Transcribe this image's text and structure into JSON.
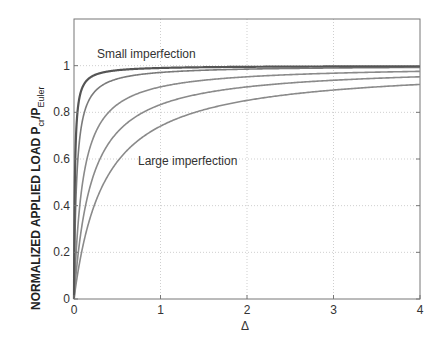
{
  "chart_data": {
    "type": "line",
    "title": "",
    "xlabel": "Δ",
    "ylabel": "NORMALIZED APPLIED LOAD P_cr/P_Euler",
    "ylabel_parts": {
      "main": "NORMALIZED APPLIED LOAD P",
      "sub1": "cr",
      "slash": "/P",
      "sub2": "Euler"
    },
    "xlim": [
      0,
      4
    ],
    "ylim": [
      0,
      1.2
    ],
    "xticks": [
      0,
      1,
      2,
      3,
      4
    ],
    "xtick_labels": [
      "0",
      "1",
      "2",
      "3",
      "4"
    ],
    "yticks": [
      0,
      0.2,
      0.4,
      0.6,
      0.8,
      1
    ],
    "ytick_labels": [
      "0",
      "0.2",
      "0.4",
      "0.6",
      "0.8",
      "1"
    ],
    "grid": true,
    "legend": null,
    "annotations": [
      {
        "text": "Small imperfection",
        "x": 0.27,
        "y": 1.05
      },
      {
        "text": "Large imperfection",
        "x": 0.75,
        "y": 0.59
      }
    ],
    "series": [
      {
        "name": "imperfection e=0.01",
        "imperfection": 0.01,
        "color": "#555555",
        "width": 2.2,
        "x": [
          0,
          0.05,
          0.1,
          0.25,
          0.5,
          1,
          2,
          3,
          4
        ],
        "values": [
          0,
          0.83,
          0.91,
          0.96,
          0.98,
          0.99,
          0.995,
          0.997,
          0.998
        ]
      },
      {
        "name": "imperfection e=0.03",
        "imperfection": 0.03,
        "color": "#7a7a7a",
        "width": 1.6,
        "x": [
          0,
          0.05,
          0.1,
          0.25,
          0.5,
          1,
          2,
          3,
          4
        ],
        "values": [
          0,
          0.63,
          0.77,
          0.89,
          0.94,
          0.97,
          0.985,
          0.99,
          0.993
        ]
      },
      {
        "name": "imperfection e=0.1",
        "imperfection": 0.1,
        "color": "#8a8a8a",
        "width": 1.6,
        "x": [
          0,
          0.05,
          0.1,
          0.25,
          0.5,
          1,
          2,
          3,
          4
        ],
        "values": [
          0,
          0.33,
          0.5,
          0.71,
          0.83,
          0.91,
          0.95,
          0.97,
          0.976
        ]
      },
      {
        "name": "imperfection e=0.2",
        "imperfection": 0.2,
        "color": "#8a8a8a",
        "width": 1.6,
        "x": [
          0,
          0.05,
          0.1,
          0.25,
          0.5,
          1,
          2,
          3,
          4
        ],
        "values": [
          0,
          0.2,
          0.33,
          0.56,
          0.71,
          0.83,
          0.91,
          0.94,
          0.952
        ]
      },
      {
        "name": "imperfection e=0.35",
        "imperfection": 0.35,
        "color": "#8a8a8a",
        "width": 1.6,
        "x": [
          0,
          0.05,
          0.1,
          0.25,
          0.5,
          1,
          2,
          3,
          4
        ],
        "values": [
          0,
          0.125,
          0.22,
          0.42,
          0.59,
          0.74,
          0.85,
          0.9,
          0.92
        ]
      }
    ]
  }
}
